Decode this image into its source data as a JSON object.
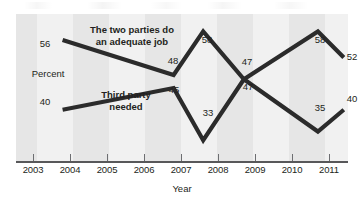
{
  "chart_data": {
    "type": "line",
    "title": "",
    "xlabel": "Year",
    "ylabel": "Percent",
    "x": [
      2003,
      2004,
      2005,
      2006,
      2007,
      2008,
      2009,
      2010,
      2011
    ],
    "tick_labels": [
      "2003",
      "2004",
      "2005",
      "2006",
      "2007",
      "2008",
      "2009",
      "2010",
      "2011"
    ],
    "xlim": [
      2002.5,
      2011.6
    ],
    "ylim": [
      28,
      62
    ],
    "grid": false,
    "legend": "inline-annotations",
    "series": [
      {
        "name": "The two parties do an adequate job",
        "color": "#2b2b2b",
        "x": [
          2003.8,
          2006.8,
          2007.6,
          2008.7,
          2010.7,
          2011.4
        ],
        "values": [
          56,
          48,
          58,
          47,
          58,
          52
        ],
        "point_labels": [
          "56",
          "48",
          "58",
          "47",
          "58",
          "52"
        ]
      },
      {
        "name": "Third party needed",
        "color": "#2b2b2b",
        "x": [
          2003.8,
          2006.8,
          2007.6,
          2008.7,
          2010.7,
          2011.4
        ],
        "values": [
          40,
          45,
          33,
          47,
          35,
          40
        ],
        "point_labels": [
          "40",
          "45",
          "33",
          "47",
          "35",
          "40"
        ]
      }
    ],
    "annotations": [
      {
        "text": "The two parties do",
        "line2": "an adequate job",
        "role": "series-label-upper"
      },
      {
        "text": "Third party",
        "line2": "needed",
        "role": "series-label-lower"
      },
      {
        "text": "Percent",
        "role": "y-axis-label"
      }
    ]
  },
  "labels": {
    "series_upper_line1": "The two parties do",
    "series_upper_line2": "an adequate job",
    "series_lower_line1": "Third party",
    "series_lower_line2": "needed",
    "percent": "Percent",
    "year": "Year",
    "v56": "56",
    "v40": "40",
    "v48": "48",
    "v45": "45",
    "v58a": "58",
    "v33": "33",
    "v47a": "47",
    "v47b": "47",
    "v58b": "58",
    "v35": "35",
    "v52": "52",
    "v40b": "40",
    "t2003": "2003",
    "t2004": "2004",
    "t2005": "2005",
    "t2006": "2006",
    "t2007": "2007",
    "t2008": "2008",
    "t2009": "2009",
    "t2010": "2010",
    "t2011": "2011"
  },
  "colors": {
    "line": "#2b2b2b",
    "band_dark": "#e6e6e6",
    "band_light": "#f1f1f1",
    "axis": "#58585a",
    "text": "#231f20"
  }
}
